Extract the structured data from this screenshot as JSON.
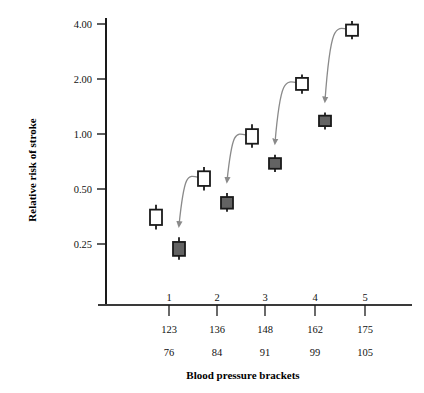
{
  "chart_data": {
    "type": "scatter",
    "title": "",
    "xlabel": "Blood pressure brackets",
    "ylabel": "Relative risk of stroke",
    "y_scale": "log2",
    "ylim": [
      0.18,
      4.6
    ],
    "yticks": [
      0.25,
      0.5,
      1.0,
      2.0,
      4.0
    ],
    "ytick_labels": [
      "0.25",
      "0.50",
      "1.00",
      "2.00",
      "4.00"
    ],
    "grid": false,
    "legend": false,
    "categories": [
      "1",
      "2",
      "3",
      "4",
      "5"
    ],
    "x_secondary_rows": [
      {
        "name": "systolic",
        "values": [
          "123",
          "136",
          "148",
          "162",
          "175"
        ]
      },
      {
        "name": "diastolic",
        "values": [
          "76",
          "84",
          "91",
          "99",
          "105"
        ]
      }
    ],
    "series": [
      {
        "name": "open",
        "marker": "open-box-whisker",
        "fill": "#ffffff",
        "stroke": "#1a1a1a",
        "points": [
          {
            "category": "1",
            "value": 0.35,
            "low": 0.3,
            "high": 0.41
          },
          {
            "category": "2",
            "value": 0.57,
            "low": 0.49,
            "high": 0.66
          },
          {
            "category": "3",
            "value": 0.97,
            "low": 0.84,
            "high": 1.13
          },
          {
            "category": "4",
            "value": 1.88,
            "low": 1.66,
            "high": 2.12
          },
          {
            "category": "5",
            "value": 3.7,
            "low": 3.3,
            "high": 4.15
          }
        ]
      },
      {
        "name": "filled",
        "marker": "filled-box-whisker",
        "fill": "#636363",
        "stroke": "#1a1a1a",
        "points": [
          {
            "category": "1",
            "value": 0.235,
            "low": 0.205,
            "high": 0.272
          },
          {
            "category": "2",
            "value": 0.42,
            "low": 0.375,
            "high": 0.475
          },
          {
            "category": "3",
            "value": 0.69,
            "low": 0.62,
            "high": 0.77
          },
          {
            "category": "4",
            "value": 1.18,
            "low": 1.06,
            "high": 1.31
          },
          {
            "category": "5",
            "value": 2.08,
            "low": 1.9,
            "high": 2.3
          }
        ]
      }
    ],
    "annotations": [
      {
        "kind": "arrow",
        "points_to": "filled-1"
      },
      {
        "kind": "arrow",
        "points_to": "filled-2"
      },
      {
        "kind": "arrow",
        "points_to": "filled-3"
      },
      {
        "kind": "arrow",
        "points_to": "filled-4"
      },
      {
        "kind": "arrow",
        "points_to": "filled-5"
      }
    ]
  }
}
